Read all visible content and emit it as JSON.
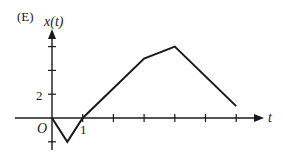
{
  "panel_label": "(E)",
  "chart_data": {
    "type": "line",
    "title": "",
    "ylabel": "x(t)",
    "xlabel": "t",
    "origin_label": "O",
    "x_tick_label": "1",
    "y_tick_label": "2",
    "x": [
      0,
      0.5,
      1,
      3,
      4,
      6
    ],
    "values": [
      0,
      -2,
      0,
      5,
      6,
      1
    ],
    "x_ticks": [
      1,
      2,
      3,
      4,
      5,
      6
    ],
    "y_ticks": [
      -2,
      2,
      4,
      6
    ],
    "xlim": [
      -3,
      7
    ],
    "ylim": [
      -3,
      8
    ],
    "grid": false,
    "legend": null,
    "line_color": "#1a1a1a",
    "axis_color": "#1a1a1a"
  }
}
